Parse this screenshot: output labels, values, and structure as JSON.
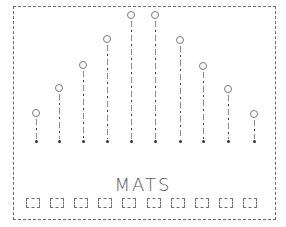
{
  "diagram": {
    "label": "MATS",
    "frame": {
      "style": "dashed-pencil",
      "color": "#6b6b6b"
    },
    "columns": [
      {
        "x": 36,
        "circle_y": 113,
        "foot_y": 141
      },
      {
        "x": 59,
        "circle_y": 88,
        "foot_y": 141
      },
      {
        "x": 83,
        "circle_y": 65,
        "foot_y": 141
      },
      {
        "x": 107,
        "circle_y": 39,
        "foot_y": 141
      },
      {
        "x": 131,
        "circle_y": 15,
        "foot_y": 141
      },
      {
        "x": 155,
        "circle_y": 15,
        "foot_y": 141
      },
      {
        "x": 180,
        "circle_y": 40,
        "foot_y": 141
      },
      {
        "x": 203,
        "circle_y": 66,
        "foot_y": 141
      },
      {
        "x": 228,
        "circle_y": 89,
        "foot_y": 141
      },
      {
        "x": 254,
        "circle_y": 114,
        "foot_y": 141
      }
    ],
    "mats": [
      {
        "x": 26
      },
      {
        "x": 50
      },
      {
        "x": 74
      },
      {
        "x": 98
      },
      {
        "x": 122
      },
      {
        "x": 147
      },
      {
        "x": 171
      },
      {
        "x": 195
      },
      {
        "x": 219
      },
      {
        "x": 243
      }
    ],
    "colors": {
      "pencil": "#6b6b6b",
      "dark": "#333333",
      "background": "#ffffff"
    }
  }
}
